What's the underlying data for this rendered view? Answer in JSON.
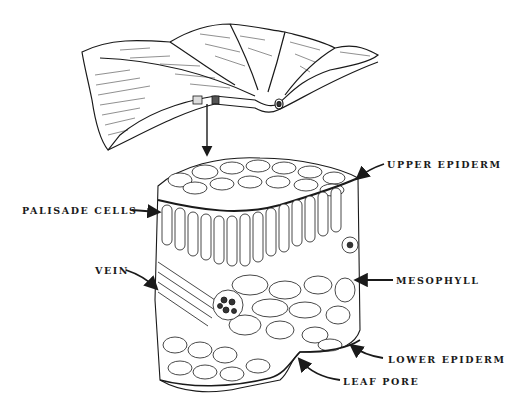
{
  "diagram": {
    "labels": {
      "upper_epidermis": "UPPER EPIDERM",
      "palisade_cells": "PALISADE CELLS",
      "vein": "VEIN",
      "mesophyll": "MESOPHYLL",
      "lower_epidermis": "LOWER EPIDERM",
      "leaf_pore": "LEAF PORE"
    },
    "colors": {
      "ink": "#1a1a1a",
      "background": "#ffffff"
    }
  }
}
